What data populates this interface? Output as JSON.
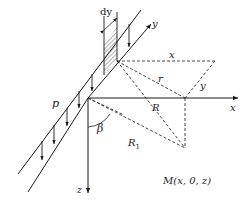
{
  "diagram": {
    "labels": {
      "dy": "dy",
      "y_axis": "y",
      "x_dist": "x",
      "r": "r",
      "y_dist": "y",
      "p": "p",
      "R": "R",
      "x_axis": "x",
      "beta": "β",
      "R1": "R",
      "R1_sub": "1",
      "z_axis": "z",
      "M": "M(x, 0, z)"
    },
    "colors": {
      "line": "#1a1a1a",
      "background": "#ffffff"
    }
  }
}
